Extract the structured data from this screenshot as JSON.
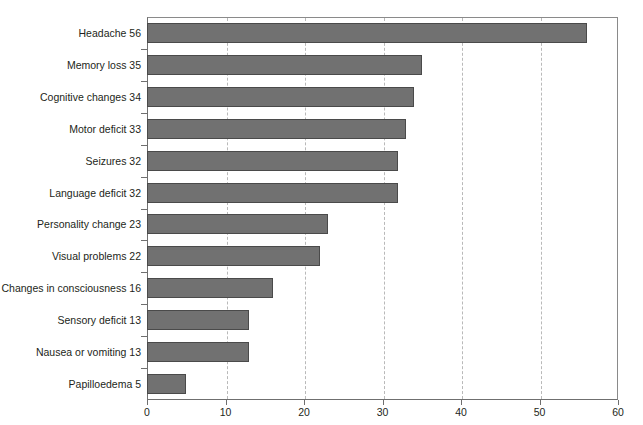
{
  "chart_data": {
    "type": "bar",
    "orientation": "horizontal",
    "title": "",
    "xlabel": "",
    "ylabel": "",
    "xlim": [
      0,
      60
    ],
    "xticks": [
      0,
      10,
      20,
      30,
      40,
      50,
      60
    ],
    "grid": "vertical-dashed",
    "legend": "none",
    "categories": [
      "Headache",
      "Memory loss",
      "Cognitive changes",
      "Motor deficit",
      "Seizures",
      "Language deficit",
      "Personality change",
      "Visual problems",
      "Changes in consciousness",
      "Sensory deficit",
      "Nausea or vomiting",
      "Papilloedema"
    ],
    "values": [
      56,
      35,
      34,
      33,
      32,
      32,
      23,
      22,
      16,
      13,
      13,
      5
    ],
    "tick_labels": [
      "Headache 56",
      "Memory loss 35",
      "Cognitive changes 34",
      "Motor deficit 33",
      "Seizures 32",
      "Language deficit 32",
      "Personality change 23",
      "Visual problems 22",
      "Changes in consciousness 16",
      "Sensory deficit 13",
      "Nausea or vomiting 13",
      "Papilloedema 5"
    ],
    "xtick_labels": [
      "0",
      "10",
      "20",
      "30",
      "40",
      "50",
      "60"
    ],
    "colors": {
      "bar_fill": "#717171",
      "bar_edge": "#4a4a4a",
      "gridline": "#b9b9b9",
      "axis": "#6f6f6f",
      "background": "#ffffff",
      "text": "#231f20"
    }
  }
}
